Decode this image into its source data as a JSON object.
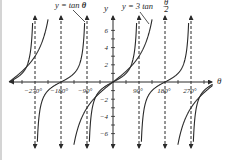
{
  "chart_data": {
    "type": "line",
    "title": "",
    "xlabel": "θ",
    "ylabel": "y",
    "xlim": [
      -360,
      350
    ],
    "ylim": [
      -7.5,
      7.5
    ],
    "grid": false,
    "x_ticks": [
      -270,
      -180,
      -90,
      90,
      180,
      270
    ],
    "x_tick_labels": [
      "−270°",
      "−180°",
      "−90°",
      "90°",
      "180°",
      "270°"
    ],
    "y_ticks": [
      -6,
      -4,
      -2,
      2,
      4,
      6
    ],
    "y_tick_labels": [
      "−6",
      "−4",
      "−2",
      "2",
      "4",
      "6"
    ],
    "asymptotes": {
      "tan": [
        -270,
        -90,
        90,
        270
      ],
      "3tan_half": [
        -180,
        180
      ],
      "all_dashed_x": [
        -270,
        -180,
        -90,
        90,
        180,
        270
      ]
    },
    "series": [
      {
        "name": "y = tan θ",
        "function": "tan(theta)",
        "period": 180,
        "sample_points": [
          [
            -360,
            0
          ],
          [
            -315,
            1
          ],
          [
            -225,
            1
          ],
          [
            -180,
            0
          ],
          [
            -135,
            -1
          ],
          [
            -45,
            -1
          ],
          [
            0,
            0
          ],
          [
            45,
            1
          ],
          [
            135,
            -1
          ],
          [
            180,
            0
          ],
          [
            225,
            1
          ],
          [
            315,
            -1
          ]
        ]
      },
      {
        "name": "y = 3 tan θ/2",
        "function": "3*tan(theta/2)",
        "period": 360,
        "sample_points": [
          [
            -360,
            0
          ],
          [
            -270,
            3
          ],
          [
            -90,
            -3
          ],
          [
            0,
            0
          ],
          [
            90,
            3
          ],
          [
            270,
            -3
          ]
        ]
      }
    ],
    "annotations": [
      {
        "text": "y = tan θ",
        "points_to": "tan curve near 90°"
      },
      {
        "text": "y = 3 tan θ/2",
        "points_to": "3tan(θ/2) curve near 90°"
      }
    ]
  },
  "labels": {
    "y_axis": "y",
    "x_axis": "θ",
    "legend_tan_prefix": "y = tan ",
    "legend_tan_var": "θ",
    "legend_3tan_prefix": "y = 3 tan ",
    "legend_3tan_num": "θ",
    "legend_3tan_den": "2",
    "xtick_m270": "−270°",
    "xtick_m180": "−180°",
    "xtick_m90": "−90°",
    "xtick_90": "90°",
    "xtick_180": "180°",
    "xtick_270": "270°",
    "ytick_6": "6",
    "ytick_4": "4",
    "ytick_2": "2",
    "ytick_m2": "−2",
    "ytick_m4": "−4",
    "ytick_m6": "−6"
  }
}
